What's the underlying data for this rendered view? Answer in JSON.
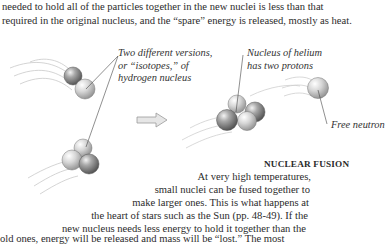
{
  "intro_text": {
    "lines": [
      "needed to hold all of the particles together in the new nuclei is less than that",
      "required in the original nucleus, and the “spare” energy is released, mostly as heat."
    ]
  },
  "diagram": {
    "labels": {
      "isotopes": [
        "Two different versions,",
        "or “isotopes,” of",
        "hydrogen nucleus"
      ],
      "helium": [
        "Nucleus of helium",
        "has two protons"
      ],
      "neutron": "Free neutron"
    },
    "arrow": "right-arrow",
    "colors": {
      "proton": "#8a8a8a",
      "neutron": "#cfcfcf",
      "line": "#444444",
      "motion_streak": "#c8c8c8"
    }
  },
  "caption": {
    "title": "NUCLEAR FUSION",
    "lines": [
      "At very high temperatures,",
      "small nuclei can be fused together to",
      "make larger ones. This is what happens at",
      "the heart of stars such as the Sun (pp. 48-49). If the",
      "new nucleus needs less energy to hold it together than the",
      "old ones, energy will be released and mass will be “lost.” The most"
    ]
  }
}
